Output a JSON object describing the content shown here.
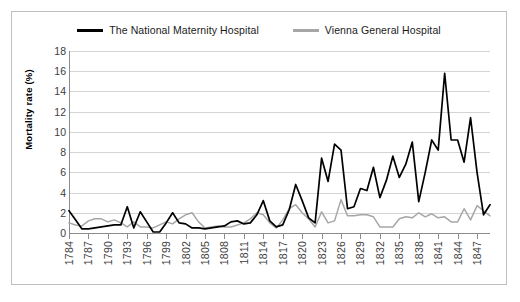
{
  "chart_data": {
    "type": "line",
    "title": "",
    "xlabel": "",
    "ylabel": "Mortality rate (%)",
    "ylim": [
      0,
      18
    ],
    "yticks": [
      0,
      2,
      4,
      6,
      8,
      10,
      12,
      14,
      16,
      18
    ],
    "grid": true,
    "legend_position": "top-center",
    "xtick_step": 3,
    "xtick_labels": [
      "1784",
      "1787",
      "1790",
      "1793",
      "1796",
      "1799",
      "1802",
      "1805",
      "1808",
      "1811",
      "1814",
      "1817",
      "1820",
      "1823",
      "1826",
      "1829",
      "1832",
      "1835",
      "1838",
      "1841",
      "1844",
      "1847"
    ],
    "x": [
      1784,
      1785,
      1786,
      1787,
      1788,
      1789,
      1790,
      1791,
      1792,
      1793,
      1794,
      1795,
      1796,
      1797,
      1798,
      1799,
      1800,
      1801,
      1802,
      1803,
      1804,
      1805,
      1806,
      1807,
      1808,
      1809,
      1810,
      1811,
      1812,
      1813,
      1814,
      1815,
      1816,
      1817,
      1818,
      1819,
      1820,
      1821,
      1822,
      1823,
      1824,
      1825,
      1826,
      1827,
      1828,
      1829,
      1830,
      1831,
      1832,
      1833,
      1834,
      1835,
      1836,
      1837,
      1838,
      1839,
      1840,
      1841,
      1842,
      1843,
      1844,
      1845,
      1846,
      1847,
      1848,
      1849
    ],
    "series": [
      {
        "name": "The National Maternity Hospital",
        "color": "#000000",
        "values": [
          2.2,
          1.3,
          0.4,
          0.4,
          0.5,
          0.6,
          0.7,
          0.8,
          0.8,
          2.6,
          0.5,
          2.1,
          1.1,
          0.1,
          0.1,
          1.0,
          2.0,
          1.0,
          0.9,
          0.5,
          0.5,
          0.4,
          0.5,
          0.6,
          0.7,
          1.1,
          1.2,
          0.9,
          1.0,
          1.8,
          3.2,
          1.2,
          0.6,
          0.8,
          2.3,
          4.8,
          3.2,
          1.5,
          1.0,
          7.4,
          5.1,
          8.8,
          8.2,
          2.4,
          2.6,
          4.4,
          4.2,
          6.5,
          3.5,
          5.2,
          7.6,
          5.5,
          6.8,
          9.0,
          3.1,
          6.0,
          9.2,
          8.2,
          15.8,
          9.2,
          9.2,
          7.0,
          11.4,
          6.0,
          1.8,
          2.8
        ]
      },
      {
        "name": "Vienna General Hospital",
        "color": "#a6a6a6",
        "values": [
          1.0,
          0.8,
          0.7,
          1.2,
          1.4,
          1.4,
          1.1,
          1.3,
          1.0,
          0.6,
          1.1,
          0.6,
          0.6,
          0.5,
          0.8,
          1.1,
          0.9,
          1.4,
          1.8,
          2.0,
          1.1,
          0.5,
          0.6,
          0.7,
          0.6,
          0.6,
          0.8,
          1.0,
          1.4,
          2.0,
          1.8,
          1.0,
          0.5,
          1.3,
          2.4,
          2.8,
          2.0,
          1.4,
          0.6,
          2.1,
          1.0,
          1.2,
          3.3,
          1.7,
          1.7,
          1.8,
          1.8,
          1.6,
          0.6,
          0.6,
          0.6,
          1.4,
          1.6,
          1.5,
          2.0,
          1.6,
          1.9,
          1.5,
          1.6,
          1.1,
          1.1,
          2.4,
          1.3,
          2.7,
          2.2,
          1.7
        ]
      }
    ]
  },
  "legend": {
    "items": [
      {
        "label": "The National Maternity Hospital",
        "color": "#000000"
      },
      {
        "label": "Vienna General Hospital",
        "color": "#a6a6a6"
      }
    ]
  },
  "axes": {
    "y_title": "Mortality rate (%)"
  }
}
